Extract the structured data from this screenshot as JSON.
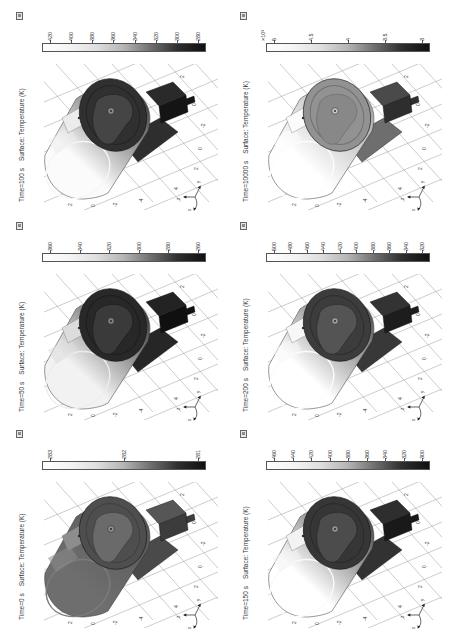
{
  "page": {
    "background": "#ffffff"
  },
  "shared": {
    "colorbar_gradient": [
      "#ffffff",
      "#f4f4f4",
      "#dedede",
      "#b4b4b4",
      "#6e6e6e",
      "#2e2e2e",
      "#101010"
    ],
    "floor_ticks_bottom": [
      "2",
      "0",
      "-2",
      "-4"
    ],
    "floor_ticks_right": [
      "2",
      "0",
      "-2",
      "0",
      "2",
      "4"
    ],
    "triad": {
      "left": "z",
      "up": "y",
      "down": "x"
    }
  },
  "panels": [
    {
      "id": "time-100s",
      "time_label": "Time=100 s",
      "surface_label": "Surface: Temperature (K)",
      "colorbar": {
        "exponent": "",
        "ticks": [
          "420",
          "400",
          "380",
          "360",
          "340",
          "320",
          "300",
          "280"
        ]
      },
      "colors": {
        "body_light": "#fbfbfb",
        "body_dark": "#3a3a3a",
        "cap": "#f6f6f6",
        "disc": "#303030",
        "ring": "#242424",
        "plate": "#454545",
        "bolt": "#8a8a8a",
        "patch": "#ececec",
        "box_top": "#2a2a2a",
        "box_side": "#141414",
        "bracket": "#2e2e2e"
      }
    },
    {
      "id": "time-10000s",
      "time_label": "Time=10000 s",
      "surface_label": "Surface: Temperature (K)",
      "colorbar": {
        "exponent": "×10³",
        "ticks": [
          "5",
          "4.5",
          "4",
          "3.5",
          "3"
        ]
      },
      "colors": {
        "body_light": "#ffffff",
        "body_dark": "#9e9e9e",
        "cap": "#fdfdfd",
        "disc": "#929292",
        "ring": "#707070",
        "plate": "#888888",
        "bolt": "#c6c6c6",
        "patch": "#fbfbfb",
        "box_top": "#4a4a4a",
        "box_side": "#2e2e2e",
        "bracket": "#6e6e6e"
      }
    },
    {
      "id": "time-50s",
      "time_label": "Time=50 s",
      "surface_label": "Surface: Temperature (K)",
      "colorbar": {
        "exponent": "",
        "ticks": [
          "360",
          "340",
          "320",
          "300",
          "280",
          "260"
        ]
      },
      "colors": {
        "body_light": "#f2f2f2",
        "body_dark": "#2e2e2e",
        "cap": "#ededed",
        "disc": "#282828",
        "ring": "#1d1d1d",
        "plate": "#3a3a3a",
        "bolt": "#808080",
        "patch": "#dcdcdc",
        "box_top": "#232323",
        "box_side": "#101010",
        "bracket": "#262626"
      }
    },
    {
      "id": "time-200s",
      "time_label": "Time=200 s",
      "surface_label": "Surface: Temperature (K)",
      "colorbar": {
        "exponent": "",
        "ticks": [
          "500",
          "480",
          "460",
          "440",
          "420",
          "400",
          "380",
          "360",
          "340",
          "320"
        ]
      },
      "colors": {
        "body_light": "#ffffff",
        "body_dark": "#484848",
        "cap": "#fcfcfc",
        "disc": "#3c3c3c",
        "ring": "#2e2e2e",
        "plate": "#545454",
        "bolt": "#9e9e9e",
        "patch": "#f7f7f7",
        "box_top": "#333333",
        "box_side": "#1d1d1d",
        "bracket": "#383838"
      }
    },
    {
      "id": "time-0s",
      "time_label": "Time=0 s",
      "surface_label": "Surface: Temperature (K)",
      "colorbar": {
        "exponent": "",
        "ticks": [
          "283",
          "282",
          "281"
        ]
      },
      "colors": {
        "body_light": "#6e6e6e",
        "body_dark": "#565656",
        "cap": "#7c7c7c",
        "disc": "#4e4e4e",
        "ring": "#404040",
        "plate": "#6a6a6a",
        "bolt": "#909090",
        "patch": "#8d8d8d",
        "box_top": "#565656",
        "box_side": "#3c3c3c",
        "bracket": "#4a4a4a"
      }
    },
    {
      "id": "time-150s",
      "time_label": "Time=150 s",
      "surface_label": "Surface: Temperature (K)",
      "colorbar": {
        "exponent": "",
        "ticks": [
          "460",
          "440",
          "420",
          "400",
          "380",
          "360",
          "340",
          "320",
          "300"
        ]
      },
      "colors": {
        "body_light": "#ffffff",
        "body_dark": "#404040",
        "cap": "#fafafa",
        "disc": "#363636",
        "ring": "#2a2a2a",
        "plate": "#4c4c4c",
        "bolt": "#949494",
        "patch": "#f3f3f3",
        "box_top": "#2e2e2e",
        "box_side": "#191919",
        "bracket": "#323232"
      }
    }
  ],
  "chart_data": [
    {
      "type": "surface",
      "subplot": "top-left",
      "title": "Time=100 s  Surface: Temperature (K)",
      "time_s": 100,
      "colorbar_unit": "K",
      "colorbar_ticks": [
        420,
        400,
        380,
        360,
        340,
        320,
        300,
        280
      ],
      "colorbar_range": [
        280,
        420
      ],
      "floor_axis_ticks": {
        "bottom": [
          2,
          0,
          -2,
          -4
        ],
        "right": [
          2,
          0,
          -2,
          0,
          2,
          4
        ]
      }
    },
    {
      "type": "surface",
      "subplot": "top-right",
      "title": "Time=10000 s  Surface: Temperature (K)",
      "time_s": 10000,
      "colorbar_unit": "K",
      "colorbar_scale": "×10³",
      "colorbar_ticks": [
        5,
        4.5,
        4,
        3.5,
        3
      ],
      "colorbar_range": [
        3000,
        5000
      ],
      "floor_axis_ticks": {
        "bottom": [
          2,
          0,
          -2,
          -4
        ],
        "right": [
          2,
          0,
          -2,
          0,
          2,
          4
        ]
      }
    },
    {
      "type": "surface",
      "subplot": "middle-left",
      "title": "Time=50 s  Surface: Temperature (K)",
      "time_s": 50,
      "colorbar_unit": "K",
      "colorbar_ticks": [
        360,
        340,
        320,
        300,
        280,
        260
      ],
      "colorbar_range": [
        260,
        360
      ],
      "floor_axis_ticks": {
        "bottom": [
          2,
          0,
          -2,
          -4
        ],
        "right": [
          2,
          0,
          -2,
          0,
          2,
          4
        ]
      }
    },
    {
      "type": "surface",
      "subplot": "middle-right",
      "title": "Time=200 s  Surface: Temperature (K)",
      "time_s": 200,
      "colorbar_unit": "K",
      "colorbar_ticks": [
        500,
        480,
        460,
        440,
        420,
        400,
        380,
        360,
        340,
        320
      ],
      "colorbar_range": [
        320,
        500
      ],
      "floor_axis_ticks": {
        "bottom": [
          2,
          0,
          -2,
          -4
        ],
        "right": [
          2,
          0,
          -2,
          0,
          2,
          4
        ]
      }
    },
    {
      "type": "surface",
      "subplot": "bottom-left",
      "title": "Time=0 s  Surface: Temperature (K)",
      "time_s": 0,
      "colorbar_unit": "K",
      "colorbar_ticks": [
        283,
        282,
        281
      ],
      "colorbar_range": [
        281,
        283
      ],
      "floor_axis_ticks": {
        "bottom": [
          2,
          0,
          -2,
          -4
        ],
        "right": [
          2,
          0,
          -2,
          0,
          2,
          4
        ]
      }
    },
    {
      "type": "surface",
      "subplot": "bottom-right",
      "title": "Time=150 s  Surface: Temperature (K)",
      "time_s": 150,
      "colorbar_unit": "K",
      "colorbar_ticks": [
        460,
        440,
        420,
        400,
        380,
        360,
        340,
        320,
        300
      ],
      "colorbar_range": [
        300,
        460
      ],
      "floor_axis_ticks": {
        "bottom": [
          2,
          0,
          -2,
          -4
        ],
        "right": [
          2,
          0,
          -2,
          0,
          2,
          4
        ]
      }
    }
  ]
}
